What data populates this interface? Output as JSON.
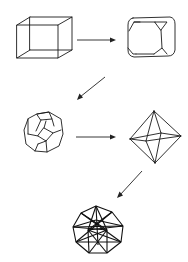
{
  "diagram": {
    "colors": {
      "line": "#1a1a1a",
      "background": "#ffffff"
    },
    "nodes": [
      {
        "id": "cube",
        "shape": "cube"
      },
      {
        "id": "truncated-cube",
        "shape": "truncated cube"
      },
      {
        "id": "truncated-octahedron",
        "shape": "truncated octahedron"
      },
      {
        "id": "octahedron",
        "shape": "octahedron"
      },
      {
        "id": "compound-polyhedron",
        "shape": "complex stellated polyhedron"
      }
    ],
    "edges": [
      {
        "from": "cube",
        "to": "truncated-cube",
        "direction": "right"
      },
      {
        "from": "truncated-cube",
        "to": "truncated-octahedron",
        "direction": "down-left"
      },
      {
        "from": "truncated-octahedron",
        "to": "octahedron",
        "direction": "right"
      },
      {
        "from": "octahedron",
        "to": "compound-polyhedron",
        "direction": "down-left"
      }
    ]
  }
}
